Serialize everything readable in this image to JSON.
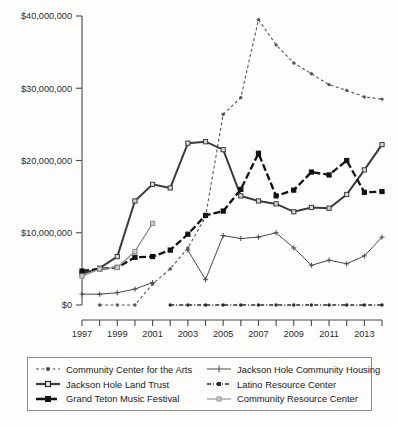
{
  "figure": {
    "title": "",
    "background_color": "#fdfdfc"
  },
  "axes": {
    "y_ticks": [
      "$0",
      "$10,000,000",
      "$20,000,000",
      "$30,000,000",
      "$40,000,000"
    ],
    "x_ticks": [
      "1997",
      "1999",
      "2001",
      "2003",
      "2005",
      "2007",
      "2009",
      "2011",
      "2013"
    ],
    "axis_color": "#4a4a4a"
  },
  "legend": {
    "columns": [
      {
        "items": [
          {
            "label": "Community Center for the Arts",
            "key": "community_center_for_the_arts",
            "swatch": "dotted-dot-marker"
          },
          {
            "label": "Jackson Hole Land Trust",
            "key": "jackson_hole_land_trust",
            "swatch": "solid-square-marker"
          },
          {
            "label": "Grand Teton Music Festival",
            "key": "grand_teton_music_festival",
            "swatch": "dashed-square-marker"
          }
        ]
      },
      {
        "items": [
          {
            "label": "Jackson Hole Community Housing",
            "key": "jackson_hole_community_housing",
            "swatch": "thin-solid-plus-marker"
          },
          {
            "label": "Latino Resource Center",
            "key": "latino_resource_center",
            "swatch": "dash-dot-marker"
          },
          {
            "label": "Community Resource Center",
            "key": "community_resource_center",
            "swatch": "thin-gray-marker"
          }
        ]
      }
    ]
  },
  "chart_data": {
    "type": "line",
    "title": "",
    "xlabel": "",
    "ylabel": "",
    "xlim": [
      1997,
      2014
    ],
    "ylim": [
      0,
      40000000
    ],
    "grid": false,
    "legend_position": "bottom",
    "x": [
      1997,
      1998,
      1999,
      2000,
      2001,
      2002,
      2003,
      2004,
      2005,
      2006,
      2007,
      2008,
      2009,
      2010,
      2011,
      2012,
      2013,
      2014
    ],
    "series": [
      {
        "name": "Community Center for the Arts",
        "style": "dotted",
        "marker": "dot",
        "color": "#555555",
        "values": [
          null,
          0,
          0,
          0,
          2900000,
          5000000,
          7900000,
          12200000,
          26400000,
          28700000,
          39500000,
          36000000,
          33500000,
          32000000,
          30500000,
          29700000,
          28800000,
          28500000
        ]
      },
      {
        "name": "Jackson Hole Land Trust",
        "style": "solid",
        "marker": "square",
        "color": "#3a3a3a",
        "values": [
          4300000,
          5100000,
          6700000,
          14400000,
          16700000,
          16200000,
          22400000,
          22600000,
          21500000,
          15100000,
          14400000,
          14000000,
          12900000,
          13500000,
          13400000,
          15300000,
          18700000,
          22200000
        ]
      },
      {
        "name": "Grand Teton Music Festival",
        "style": "dashed",
        "marker": "square",
        "color": "#111111",
        "values": [
          4700000,
          5000000,
          5200000,
          6600000,
          6700000,
          7600000,
          9800000,
          12400000,
          13000000,
          16000000,
          21000000,
          15100000,
          15900000,
          18400000,
          18000000,
          20000000,
          15600000,
          15700000
        ]
      },
      {
        "name": "Jackson Hole Community Housing",
        "style": "thin-solid",
        "marker": "plus",
        "color": "#4a4a4a",
        "values": [
          1500000,
          1500000,
          1700000,
          2200000,
          3100000,
          null,
          7600000,
          3500000,
          9600000,
          9200000,
          9400000,
          10000000,
          7900000,
          5500000,
          6200000,
          5700000,
          6800000,
          9400000
        ]
      },
      {
        "name": "Latino Resource Center",
        "style": "dash-dot",
        "marker": "dot",
        "color": "#2a2a2a",
        "values": [
          null,
          null,
          null,
          null,
          null,
          0,
          0,
          0,
          0,
          0,
          0,
          0,
          0,
          0,
          0,
          0,
          0,
          0
        ]
      },
      {
        "name": "Community Resource Center",
        "style": "thin-gray",
        "marker": "square",
        "color": "#8a8a8a",
        "values": [
          4000000,
          5000000,
          5200000,
          7400000,
          11300000,
          null,
          null,
          null,
          null,
          null,
          null,
          null,
          null,
          null,
          null,
          null,
          null,
          null
        ]
      }
    ]
  }
}
